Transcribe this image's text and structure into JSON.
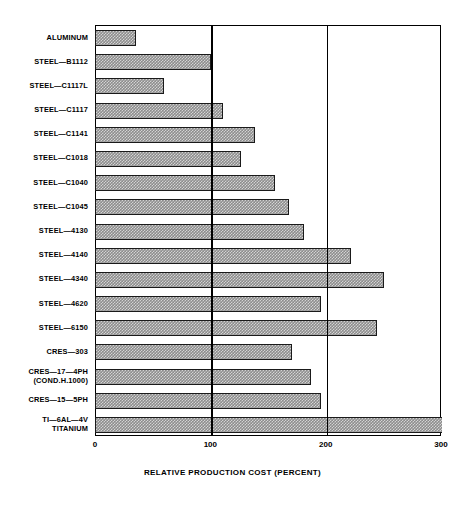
{
  "chart_data": {
    "type": "bar",
    "orientation": "horizontal",
    "title": "",
    "xlabel": "RELATIVE PRODUCTION COST (PERCENT)",
    "ylabel": "",
    "xlim": [
      0,
      300
    ],
    "xticks": [
      0,
      100,
      200,
      300
    ],
    "xtick_labels": [
      "0",
      "100",
      "200",
      "300"
    ],
    "grid": "vertical-major",
    "legend": "none",
    "categories": [
      "ALUMINUM",
      "STEEL—B1112",
      "STEEL—C1117L",
      "STEEL—C1117",
      "STEEL—C1141",
      "STEEL—C1018",
      "STEEL—C1040",
      "STEEL—C1045",
      "STEEL—4130",
      "STEEL—4140",
      "STEEL—4340",
      "STEEL—4620",
      "STEEL—6150",
      "CRES—303",
      "CRES—17—4PH",
      "CRES—15—5PH",
      "TI—6AL—4V"
    ],
    "category_sublabels": {
      "CRES—17—4PH": "(COND.H.1000)",
      "TI—6AL—4V": "TITANIUM"
    },
    "values": [
      35,
      100,
      59,
      110,
      138,
      126,
      155,
      167,
      180,
      221,
      250,
      195,
      244,
      170,
      186,
      195,
      300
    ],
    "value_unit": "percent",
    "bar_color": "#8d8d8d",
    "bar_edge_color": "#1a1a1a",
    "axis_color": "#000000",
    "background_color": "#ffffff"
  },
  "axis": {
    "x_title": "RELATIVE PRODUCTION COST (PERCENT)"
  }
}
